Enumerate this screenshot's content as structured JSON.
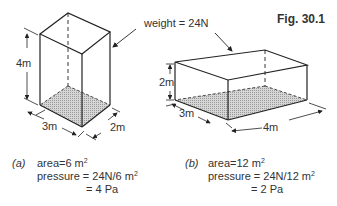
{
  "figure": {
    "title": "Fig. 30.1",
    "weight_label": "weight = 24N",
    "box_a": {
      "height": "4m",
      "width": "3m",
      "depth": "2m"
    },
    "box_b": {
      "height": "2m",
      "width": "3m",
      "depth": "4m"
    }
  },
  "calculations": {
    "a": {
      "label": "(a)",
      "area_prefix": "area=6 m",
      "area_exp": "2",
      "pressure_prefix": "pressure = 24N/6 m",
      "pressure_exp": "2",
      "result": "= 4 Pa"
    },
    "b": {
      "label": "(b)",
      "area_prefix": "area=12 m",
      "area_exp": "2",
      "pressure_prefix": "pressure = 24N/12 m",
      "pressure_exp": "2",
      "result": "= 2 Pa"
    }
  },
  "colors": {
    "line": "#222222",
    "shade": "#bdbdbd",
    "text": "#333333"
  }
}
